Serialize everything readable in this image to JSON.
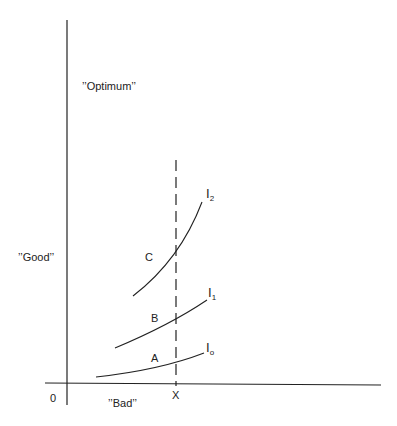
{
  "diagram": {
    "labels": {
      "optimum": "’’Optimum’’",
      "good": "’’Good’’",
      "bad": "’’Bad’’",
      "origin": "0",
      "x_marker": "X",
      "region_a": "A",
      "region_b": "B",
      "region_c": "C"
    },
    "curves": [
      {
        "name": "I",
        "sub": "o"
      },
      {
        "name": "I",
        "sub": "1"
      },
      {
        "name": "I",
        "sub": "2"
      }
    ]
  }
}
